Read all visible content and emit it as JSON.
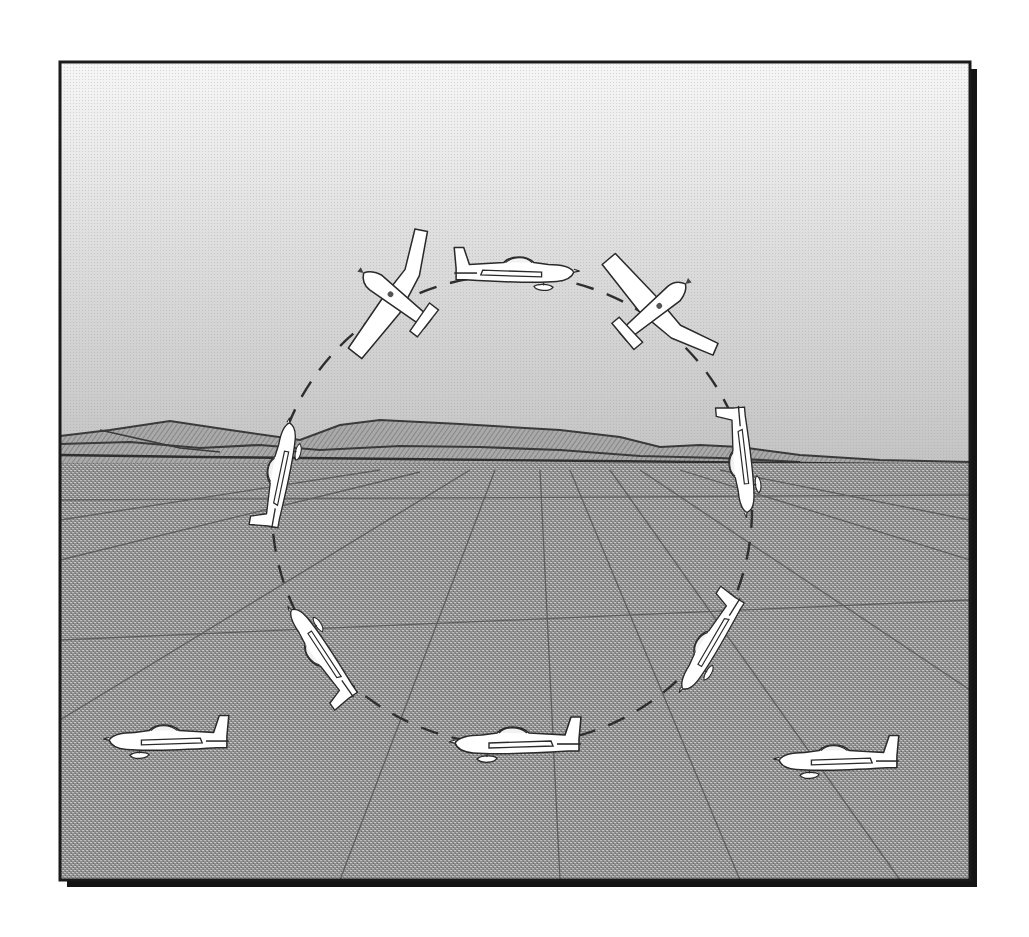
{
  "figure": {
    "frame": {
      "x": 60,
      "y": 62,
      "width": 910,
      "height": 818,
      "shadow_offset": 7
    },
    "colors": {
      "frame_border": "#1a1a1a",
      "sky_top": "#f4f4f4",
      "sky_bottom": "#c9c9c9",
      "mountain_fill": "#9e9e9e",
      "mountain_line": "#3a3a3a",
      "ground": "#8d8d8d",
      "ground_lines": "#4a4a4a",
      "airplane_fill": "#ffffff",
      "airplane_outline": "#2a2a2a",
      "loop_path": "#2e2e2e"
    },
    "horizon_y": 460,
    "loop": {
      "cx": 512,
      "cy": 510,
      "rx": 240,
      "ry": 235,
      "style": "dashed"
    },
    "airplanes": [
      {
        "id": "entry-left",
        "x": 168,
        "y": 742,
        "rotation": 0,
        "scale": 1.0
      },
      {
        "id": "loop-bottom",
        "x": 517,
        "y": 745,
        "rotation": 0,
        "scale": 1.0
      },
      {
        "id": "pull-up",
        "x": 712,
        "y": 645,
        "rotation": -62,
        "scale": 0.95
      },
      {
        "id": "vertical-climb",
        "x": 744,
        "y": 460,
        "rotation": -95,
        "scale": 0.95
      },
      {
        "id": "top-right-inverting",
        "x": 652,
        "y": 308,
        "rotation": 145,
        "scale": 1.0
      },
      {
        "id": "loop-top-inverted",
        "x": 515,
        "y": 273,
        "rotation": 180,
        "scale": 1.0
      },
      {
        "id": "top-left-descending",
        "x": 398,
        "y": 300,
        "rotation": 215,
        "scale": 1.0
      },
      {
        "id": "vertical-dive",
        "x": 282,
        "y": 475,
        "rotation": 260,
        "scale": 0.95
      },
      {
        "id": "recovery",
        "x": 323,
        "y": 652,
        "rotation": 300,
        "scale": 0.95
      },
      {
        "id": "exit-right",
        "x": 838,
        "y": 762,
        "rotation": 0,
        "scale": 1.0
      }
    ]
  }
}
